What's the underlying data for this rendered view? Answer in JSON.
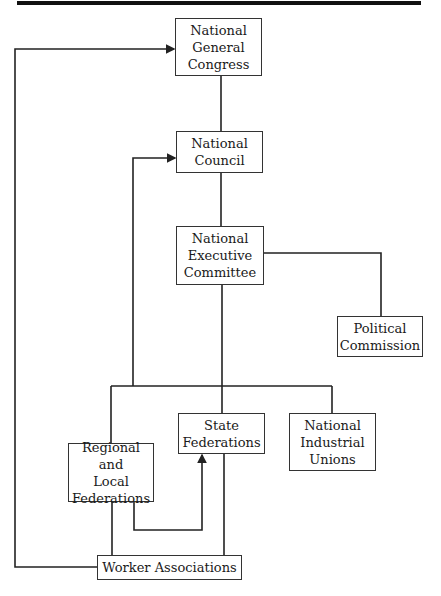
{
  "diagram": {
    "nodes": [
      {
        "id": "ngc",
        "label": "National\nGeneral\nCongress",
        "x": 175,
        "y": 18,
        "w": 87,
        "h": 58
      },
      {
        "id": "nc",
        "label": "National\nCouncil",
        "x": 176,
        "y": 131,
        "w": 87,
        "h": 42
      },
      {
        "id": "nec",
        "label": "National\nExecutive\nCommittee",
        "x": 176,
        "y": 226,
        "w": 88,
        "h": 59
      },
      {
        "id": "pc",
        "label": "Political\nCommission",
        "x": 337,
        "y": 316,
        "w": 86,
        "h": 41
      },
      {
        "id": "sf",
        "label": "State\nFederations",
        "x": 178,
        "y": 413,
        "w": 87,
        "h": 41
      },
      {
        "id": "niu",
        "label": "National\nIndustrial\nUnions",
        "x": 289,
        "y": 413,
        "w": 87,
        "h": 58
      },
      {
        "id": "rlf",
        "label": "Regional and\nLocal\nFederations",
        "x": 68,
        "y": 443,
        "w": 86,
        "h": 59
      },
      {
        "id": "wa",
        "label": "Worker Associations",
        "x": 97,
        "y": 555,
        "w": 145,
        "h": 25
      }
    ],
    "edges": [
      {
        "from": "ngc",
        "to": "nc",
        "type": "line"
      },
      {
        "from": "nc",
        "to": "nec",
        "type": "line"
      },
      {
        "from": "nec",
        "to": "pc",
        "type": "line"
      },
      {
        "from": "nec",
        "to": "sf",
        "type": "line"
      },
      {
        "from": "nec",
        "to": "niu",
        "type": "line"
      },
      {
        "from": "nec",
        "to": "rlf",
        "type": "line"
      },
      {
        "from": "rlf",
        "to": "nc",
        "type": "arrow"
      },
      {
        "from": "wa",
        "to": "ngc",
        "type": "arrow"
      },
      {
        "from": "rlf",
        "to": "sf",
        "type": "arrow"
      },
      {
        "from": "rlf",
        "to": "wa",
        "type": "line"
      },
      {
        "from": "sf",
        "to": "wa",
        "type": "line"
      }
    ]
  }
}
